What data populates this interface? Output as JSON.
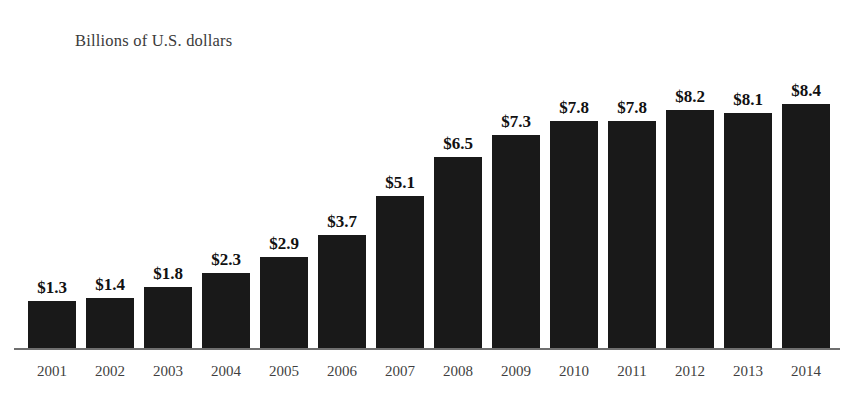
{
  "chart_data": {
    "type": "bar",
    "title": "Billions of U.S. dollars",
    "xlabel": "",
    "ylabel": "",
    "grid": false,
    "legend": "none",
    "ylim": [
      0,
      9
    ],
    "categories": [
      "2001",
      "2002",
      "2003",
      "2004",
      "2005",
      "2006",
      "2007",
      "2008",
      "2009",
      "2010",
      "2011",
      "2012",
      "2013",
      "2014"
    ],
    "values": [
      1.3,
      1.4,
      1.8,
      2.3,
      2.9,
      3.7,
      5.1,
      6.5,
      7.3,
      7.8,
      7.8,
      8.2,
      8.1,
      8.4
    ],
    "value_labels": [
      "$1.3",
      "$1.4",
      "$1.8",
      "$2.3",
      "$2.9",
      "$3.7",
      "$5.1",
      "$6.5",
      "$7.3",
      "$7.8",
      "$7.8",
      "$8.2",
      "$8.1",
      "$8.4"
    ],
    "bar_color": "#191919",
    "axis_color": "#6f6f6f",
    "label_color": "#111111",
    "title_color": "#3b3b3b",
    "background": "#ffffff"
  }
}
